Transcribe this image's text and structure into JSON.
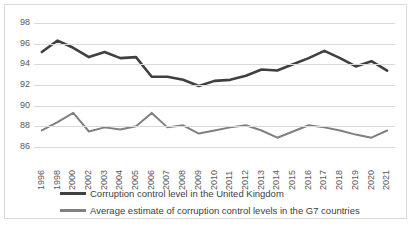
{
  "chart_data": {
    "type": "line",
    "title": "",
    "xlabel": "",
    "ylabel": "",
    "ylim": [
      86,
      98
    ],
    "yticks": [
      86,
      88,
      90,
      92,
      94,
      96,
      98
    ],
    "grid": true,
    "legend_position": "bottom",
    "categories": [
      "1996",
      "1998",
      "2000",
      "2002",
      "2003",
      "2004",
      "2005",
      "2006",
      "2007",
      "2008",
      "2009",
      "2010",
      "2011",
      "2012",
      "2013",
      "2014",
      "2015",
      "2016",
      "2017",
      "2018",
      "2019",
      "2020",
      "2021"
    ],
    "series": [
      {
        "name": "Corruption control level in the United Kingdom",
        "color": "#404040",
        "width": 2.6,
        "values": [
          95.2,
          96.3,
          95.6,
          94.7,
          95.2,
          94.6,
          94.7,
          92.8,
          92.8,
          92.5,
          91.9,
          92.4,
          92.5,
          92.9,
          93.5,
          93.4,
          94.0,
          94.6,
          95.3,
          94.6,
          93.8,
          94.3,
          93.4
        ]
      },
      {
        "name": "Average estimate of corruption control levels in the G7 countries",
        "color": "#808080",
        "width": 2.0,
        "values": [
          87.6,
          88.4,
          89.3,
          87.5,
          87.9,
          87.7,
          88.0,
          89.3,
          87.9,
          88.1,
          87.3,
          87.6,
          87.9,
          88.1,
          87.6,
          86.9,
          87.5,
          88.1,
          87.9,
          87.6,
          87.2,
          86.9,
          87.6
        ]
      }
    ]
  },
  "yaxis": {
    "labels": [
      "98",
      "96",
      "94",
      "92",
      "90",
      "88",
      "86"
    ]
  },
  "xaxis": {
    "labels": [
      "1996",
      "1998",
      "2000",
      "2002",
      "2003",
      "2004",
      "2005",
      "2006",
      "2007",
      "2008",
      "2009",
      "2010",
      "2011",
      "2012",
      "2013",
      "2014",
      "2015",
      "2016",
      "2017",
      "2018",
      "2019",
      "2020",
      "2021"
    ]
  },
  "legend": {
    "items": [
      {
        "label": "Corruption control level in the United Kingdom",
        "color": "#404040"
      },
      {
        "label": "Average estimate of corruption control levels in the G7 countries",
        "color": "#808080"
      }
    ]
  },
  "colors": {
    "uk_series": "#404040",
    "g7_series": "#808080",
    "gridline": "#D9D9D9",
    "border": "#D9D9D9",
    "text": "#595959",
    "background": "#FFFFFF"
  }
}
